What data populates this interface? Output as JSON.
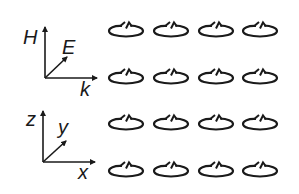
{
  "axes_em": {
    "vertical_label": "H",
    "diagonal_label": "E",
    "horizontal_label": "k"
  },
  "axes_xyz": {
    "vertical_label": "z",
    "diagonal_label": "y",
    "horizontal_label": "x"
  },
  "array": {
    "element": "split-ring-resonator",
    "rows": 4,
    "columns": 4,
    "stroke_color": "#1a1a1a"
  }
}
